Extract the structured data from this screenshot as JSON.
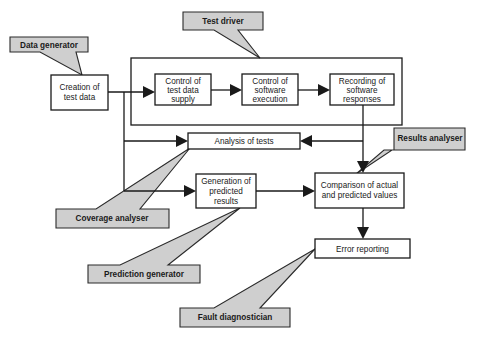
{
  "diagram": {
    "type": "flowchart",
    "processes": {
      "creation": {
        "line1": "Creation of",
        "line2": "test data"
      },
      "supply": {
        "line1": "Control of",
        "line2": "test data",
        "line3": "supply"
      },
      "execution": {
        "line1": "Control of",
        "line2": "software",
        "line3": "execution"
      },
      "recording": {
        "line1": "Recording of",
        "line2": "software",
        "line3": "responses"
      },
      "analysis": {
        "line1": "Analysis of tests"
      },
      "generation": {
        "line1": "Generation of",
        "line2": "predicted",
        "line3": "results"
      },
      "comparison": {
        "line1": "Comparison of actual",
        "line2": "and predicted values"
      },
      "error": {
        "line1": "Error reporting"
      }
    },
    "callouts": {
      "data_generator": "Data generator",
      "test_driver": "Test driver",
      "results_analyser": "Results analyser",
      "coverage_analyser": "Coverage analyser",
      "prediction_generator": "Prediction generator",
      "fault_diagnostician": "Fault diagnostician"
    },
    "edges": [
      {
        "from": "Creation of test data",
        "to": "Control of test data supply"
      },
      {
        "from": "Control of test data supply",
        "to": "Control of software execution"
      },
      {
        "from": "Control of software execution",
        "to": "Recording of software responses"
      },
      {
        "from": "Creation of test data",
        "to": "Analysis of tests"
      },
      {
        "from": "Creation of test data",
        "to": "Generation of predicted results"
      },
      {
        "from": "Recording of software responses",
        "to": "Analysis of tests"
      },
      {
        "from": "Recording of software responses",
        "to": "Comparison of actual and predicted values"
      },
      {
        "from": "Generation of predicted results",
        "to": "Comparison of actual and predicted values"
      },
      {
        "from": "Comparison of actual and predicted values",
        "to": "Error reporting"
      }
    ],
    "colors": {
      "callout_fill": "#cfcfcf",
      "stroke": "#1a1a1a",
      "background": "#ffffff"
    }
  }
}
